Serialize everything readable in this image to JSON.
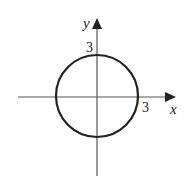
{
  "diagram": {
    "title": "",
    "x_axis": {
      "label": "x",
      "tick_label": "3"
    },
    "y_axis": {
      "label": "y",
      "tick_label": "3"
    },
    "circle": {
      "center": [
        0,
        0
      ],
      "radius": 3
    },
    "colors": {
      "stroke": "#222222",
      "axis": "#555555",
      "background": "#ffffff"
    }
  }
}
